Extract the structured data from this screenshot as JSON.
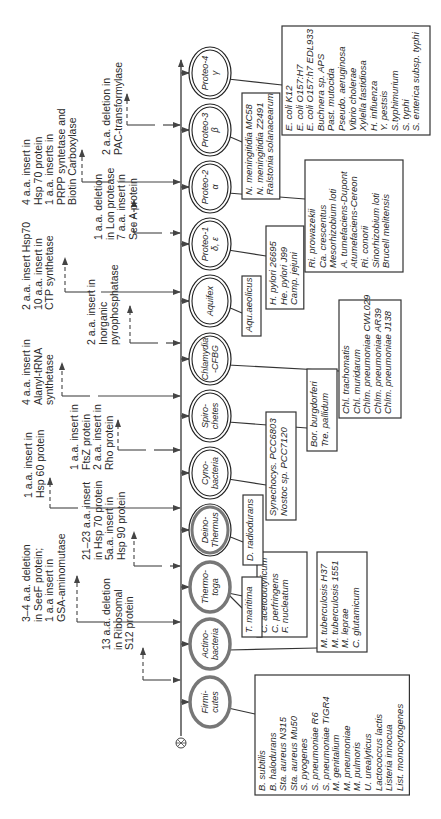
{
  "diagram": {
    "axis": {
      "x": 181,
      "y_top": 60,
      "y_bottom": 736,
      "root_y": 743,
      "root_icon": "root-node-icon"
    },
    "colors": {
      "line": "#444444",
      "text": "#2a2a2a",
      "ring_gray": "#777777",
      "ring_black": "#222222",
      "box_border": "#333333"
    },
    "taxa": [
      {
        "id": "firmicutes",
        "label": [
          "Firmi-",
          "cutes"
        ],
        "y": 702,
        "ring": "gray"
      },
      {
        "id": "actinobacteria",
        "label": [
          "Actino-",
          "bacteria"
        ],
        "y": 644,
        "ring": "gray"
      },
      {
        "id": "thermotoga",
        "label": [
          "Thermo-",
          "toga"
        ],
        "y": 587,
        "ring": "gray"
      },
      {
        "id": "deinothermus",
        "label": [
          "Deino-",
          "Thermus"
        ],
        "y": 530,
        "ring": "mixed"
      },
      {
        "id": "cyanobacteria",
        "label": [
          "Cyno-",
          "bacteria"
        ],
        "y": 473,
        "ring": "double"
      },
      {
        "id": "spirochetes",
        "label": [
          "Spiro-",
          "chetes"
        ],
        "y": 416,
        "ring": "double"
      },
      {
        "id": "chlamydia",
        "label": [
          "Chlamydia",
          "-CFBG"
        ],
        "y": 359,
        "ring": "double"
      },
      {
        "id": "aquifex",
        "label": [
          "Aquifex"
        ],
        "y": 301,
        "ring": "double"
      },
      {
        "id": "proteo1",
        "label": [
          "Proteo-1",
          "δ, ε"
        ],
        "y": 244,
        "ring": "double"
      },
      {
        "id": "proteo2",
        "label": [
          "Proteo-2",
          "α"
        ],
        "y": 187,
        "ring": "double"
      },
      {
        "id": "proteo3",
        "label": [
          "Proteo-3",
          "β"
        ],
        "y": 130,
        "ring": "double"
      },
      {
        "id": "proteo4",
        "label": [
          "Proteo-4",
          "γ"
        ],
        "y": 73,
        "ring": "double"
      }
    ],
    "annotations": [
      {
        "y": 680,
        "x0": 143,
        "dash_top": 648,
        "text_x": 110,
        "text_y": 650,
        "lines": [
          "13 a.a. deletion",
          "in Ribosomal",
          "S12 protein"
        ]
      },
      {
        "y": 622,
        "x0": 77,
        "dash_top": 576,
        "text_x": 30,
        "text_y": 622,
        "lines": [
          "3–4 a.a. deletion",
          "in SeeF protein;",
          "1 a.a insert in",
          "GSA-aminomutase"
        ]
      },
      {
        "y": 566,
        "x0": 134,
        "dash_top": 532,
        "text_x": 90,
        "text_y": 560,
        "lines": [
          "21–23 a.a. insert",
          "in Hsp 70 protein",
          "5a.a. insert in",
          "Hsp 90 protein"
        ]
      },
      {
        "y": 508,
        "x0": 50,
        "dash_top": 478,
        "text_x": 32,
        "text_y": 498,
        "lines": [
          "1 a.a. insert in",
          "Hsp 60 protein"
        ]
      },
      {
        "y": 450,
        "x0": 118,
        "dash_top": 420,
        "text_x": 78,
        "text_y": 470,
        "lines": [
          "1 a.a. insert in",
          "FtsZ protein",
          "2 a.a. insert in",
          "Rho protein"
        ]
      },
      {
        "y": 396,
        "x0": 62,
        "dash_top": 363,
        "text_x": 30,
        "text_y": 405,
        "lines": [
          "4 a.a. insert in",
          "Alanyl-tRNA",
          "synthetase"
        ]
      },
      {
        "y": 343,
        "x0": 130,
        "dash_top": 306,
        "text_x": 95,
        "text_y": 345,
        "lines": [
          "2 a.a. insert in",
          "Inorganic",
          "pyrophosphatase"
        ]
      },
      {
        "y": 292,
        "x0": 65,
        "dash_top": 258,
        "text_x": 30,
        "text_y": 310,
        "lines": [
          "2 a.a. insert Hsp70",
          "10 a.a. insert in",
          "CTP synthetase"
        ]
      },
      {
        "y": 233,
        "x0": 134,
        "dash_top": 200,
        "text_x": 102,
        "text_y": 240,
        "lines": [
          "1 a.a. deletion",
          "in Lon protease",
          "7 a.a. insert in",
          "Sec A protein"
        ]
      },
      {
        "y": 182,
        "x0": 82,
        "dash_top": 150,
        "text_x": 30,
        "text_y": 205,
        "lines": [
          "4 a.a. insert in",
          "Hsp 70 protein",
          "1 a.a. inserts in",
          "PRPP syntetase and",
          "Biotin Carboxylase"
        ]
      },
      {
        "y": 125,
        "x0": 127,
        "dash_top": 94,
        "text_x": 110,
        "text_y": 155,
        "lines": [
          "2 a.a. deletion in",
          "PAC-transformylase"
        ]
      }
    ],
    "species_boxes": [
      {
        "taxon": "firmicutes",
        "x": 255,
        "y": 675,
        "w": 30,
        "h": 120,
        "anchor_y": 702,
        "lines": [
          "B. subtilis",
          "B. halodurans",
          "Sta. aureus N315",
          "Sta. aureus Mu50",
          "S. pyogenes",
          "S. pneumoniae R6",
          "S. pneumoniae TIGR4",
          "M. genitalium",
          "M. pneumoniae",
          "M. pulmoris",
          "U. urealyticus",
          "Lactococcus lactis",
          "Listeria innocua",
          "List. monocytogenes"
        ]
      },
      {
        "taxon": "actinobacteria",
        "x": 317,
        "y": 552,
        "w": 50,
        "h": 100,
        "anchor_y": 644,
        "lines": [
          "M. tuberculosis H37",
          "M. tuberculosis 1551",
          "M. leprae",
          "C. glutamicum"
        ]
      },
      {
        "taxon": "thermotoga",
        "x": 257,
        "y": 552,
        "w": 50,
        "h": 85,
        "anchor_y": 587,
        "lines": [
          "C. acetobutylicum",
          "C. perfringens",
          "F. nucleatum"
        ]
      },
      {
        "taxon": "thermotoga-tm",
        "x": 242,
        "y": 577,
        "w": 20,
        "h": 60,
        "anchor_y": 600,
        "lines": [
          "T. maritima"
        ]
      },
      {
        "taxon": "deinothermus",
        "x": 243,
        "y": 495,
        "w": 20,
        "h": 70,
        "anchor_y": 530,
        "lines": [
          "D. radiodurans"
        ]
      },
      {
        "taxon": "cyanobacteria",
        "x": 266,
        "y": 412,
        "w": 30,
        "h": 108,
        "anchor_y": 473,
        "lines": [
          "Synechocys. PCC6803",
          "Nostoc sp. PCC7120"
        ]
      },
      {
        "taxon": "spirochetes",
        "x": 307,
        "y": 369,
        "w": 30,
        "h": 82,
        "anchor_y": 416,
        "lines": [
          "Bor. burgdorferi",
          "Tre. pallidum"
        ]
      },
      {
        "taxon": "chlamydia",
        "x": 339,
        "y": 300,
        "w": 62,
        "h": 118,
        "anchor_y": 359,
        "lines": [
          "Chl. trachomatis",
          "Chl. muridarum",
          "Chlm. pneumoniae CWL029",
          "Chlm. pneumoniae AR39",
          "Chlm. pneumoniae J138"
        ]
      },
      {
        "taxon": "aquifex",
        "x": 242,
        "y": 276,
        "w": 19,
        "h": 60,
        "anchor_y": 301,
        "lines": [
          "Aqu.aeolicus"
        ]
      },
      {
        "taxon": "proteo1",
        "x": 266,
        "y": 226,
        "w": 37,
        "h": 83,
        "anchor_y": 244,
        "lines": [
          "H. pylori 26695",
          "He. pylori J99",
          "Camp. jejuni"
        ]
      },
      {
        "taxon": "proteo2",
        "x": 305,
        "y": 160,
        "w": 98,
        "h": 112,
        "anchor_y": 187,
        "lines": [
          "Ri. prowazekii",
          "Ca. crescentus",
          "Mesorhizobium loti",
          "A. tumefaciens-Dupont",
          "Atumefaciens-Cereon",
          "Ri. conorii",
          "Sinorhizobium loti",
          "Brucell melitensis"
        ]
      },
      {
        "taxon": "proteo3",
        "x": 242,
        "y": 93,
        "w": 37,
        "h": 106,
        "anchor_y": 130,
        "lines": [
          "N. meningitidia MC58",
          "N. meningitidia Z2491",
          "Ralstonia solanacearum"
        ]
      },
      {
        "taxon": "proteo4",
        "x": 282,
        "y": 26,
        "w": 148,
        "h": 109,
        "anchor_y": 73,
        "lines": [
          "E. coli K12",
          "E. coli O157:H7",
          "E. coli O157:h7 EDL933",
          "Buchnera sp. APS",
          "Past. mutocida",
          "Pseudo. aeruginosa",
          "Vibrio cholerae",
          "Xylella fastidiosa",
          "H. influenza",
          "Y. pestsis",
          "S.typhimurium",
          "S. typhi",
          "S. enterica subsp. typhi"
        ]
      }
    ]
  }
}
